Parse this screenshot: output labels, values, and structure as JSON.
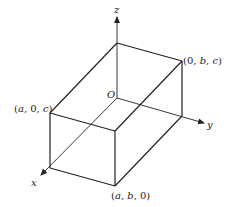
{
  "diagram": {
    "type": "3d-rectangular-box",
    "axes": {
      "x": {
        "label": "x"
      },
      "y": {
        "label": "y"
      },
      "z": {
        "label": "z"
      }
    },
    "origin_label": "O",
    "vertex_labels": {
      "a0c": {
        "open": "(",
        "v1": "a",
        "sep1": ", 0, ",
        "v2": "c",
        "close": ")"
      },
      "0bc": {
        "open": "(0, ",
        "v1": "b",
        "sep1": ", ",
        "v2": "c",
        "close": ")"
      },
      "ab0": {
        "open": "(",
        "v1": "a",
        "sep1": ", ",
        "v2": "b",
        "close": ", 0)"
      }
    },
    "stroke_color": "#222222",
    "background": "#ffffff"
  }
}
